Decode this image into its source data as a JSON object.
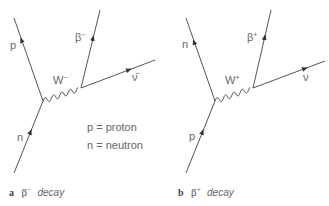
{
  "diagram_a": {
    "caption_letter": "a",
    "caption_symbol": "β",
    "caption_symbol_sup": "−",
    "caption_text": "decay",
    "labels": {
      "outgoing_hadron": "p",
      "incoming_hadron": "n",
      "boson": "W",
      "boson_sup": "−",
      "lepton": "β",
      "lepton_sup": "−",
      "neutrino": "ν̄"
    },
    "legend": [
      "p = proton",
      "n = neutron"
    ]
  },
  "diagram_b": {
    "caption_letter": "b",
    "caption_symbol": "β",
    "caption_symbol_sup": "+",
    "caption_text": "decay",
    "labels": {
      "outgoing_hadron": "n",
      "incoming_hadron": "p",
      "boson": "W",
      "boson_sup": "+",
      "lepton": "β",
      "lepton_sup": "+",
      "neutrino": "ν"
    }
  },
  "colors": {
    "line": "#555555",
    "text": "#666666"
  }
}
